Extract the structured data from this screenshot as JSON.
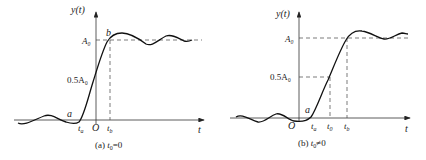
{
  "panels": [
    {
      "id": "a",
      "caption": "(a) t₀=0",
      "y_axis_label": "y(t)",
      "x_axis_label": "t",
      "origin_label": "O",
      "level_labels": {
        "A0": "A₀",
        "half_A0": "0.5A₀"
      },
      "point_labels": {
        "a": "a",
        "b": "b"
      },
      "tick_labels": {
        "ta": "tₐ",
        "tb": "t♭"
      }
    },
    {
      "id": "b",
      "caption": "(b) t₀≠0",
      "y_axis_label": "y(t)",
      "x_axis_label": "t",
      "origin_label": "O",
      "level_labels": {
        "A0": "A₀",
        "half_A0": "0.5A₀"
      },
      "point_labels": {
        "a": "a"
      },
      "tick_labels": {
        "ta": "tₐ",
        "t0": "t₀",
        "tb": "t_b"
      }
    }
  ]
}
